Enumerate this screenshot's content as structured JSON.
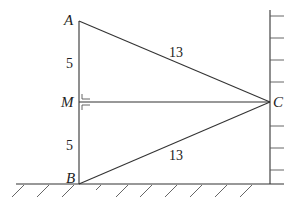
{
  "diagram": {
    "type": "geometry",
    "points": {
      "A": {
        "label": "A",
        "x": 79,
        "y": 21
      },
      "M": {
        "label": "M",
        "x": 79,
        "y": 102
      },
      "B": {
        "label": "B",
        "x": 79,
        "y": 184
      },
      "C": {
        "label": "C",
        "x": 270,
        "y": 102
      }
    },
    "segments": [
      {
        "from": "A",
        "to": "C",
        "length_label": "13"
      },
      {
        "from": "B",
        "to": "C",
        "length_label": "13"
      },
      {
        "from": "A",
        "to": "M",
        "length_label": "5"
      },
      {
        "from": "M",
        "to": "B",
        "length_label": "5"
      },
      {
        "from": "M",
        "to": "C",
        "length_label": ""
      }
    ],
    "right_angle_at": "M",
    "labels": {
      "A": "A",
      "M": "M",
      "B": "B",
      "C": "C",
      "AM": "5",
      "MB": "5",
      "AC": "13",
      "BC": "13"
    },
    "ground": {
      "description": "hatched horizontal ground line"
    },
    "wall": {
      "description": "vertical wall with tick marks on right side"
    }
  }
}
